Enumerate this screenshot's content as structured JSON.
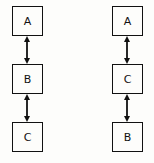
{
  "diagram": {
    "background_color": "#fdfdfb",
    "stroke_color": "#111111",
    "chains": [
      {
        "name": "left-chain",
        "nodes": [
          {
            "label": "A"
          },
          {
            "label": "B"
          },
          {
            "label": "C"
          }
        ],
        "connectors": [
          {
            "kind": "double-headed-arrow",
            "from": "A",
            "to": "B"
          },
          {
            "kind": "double-headed-arrow",
            "from": "B",
            "to": "C"
          }
        ]
      },
      {
        "name": "right-chain",
        "nodes": [
          {
            "label": "A"
          },
          {
            "label": "C"
          },
          {
            "label": "B"
          }
        ],
        "connectors": [
          {
            "kind": "double-headed-arrow",
            "from": "A",
            "to": "C"
          },
          {
            "kind": "double-headed-arrow",
            "from": "C",
            "to": "B"
          }
        ]
      }
    ]
  }
}
